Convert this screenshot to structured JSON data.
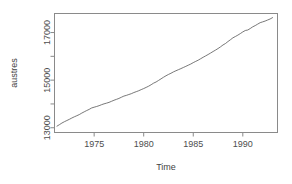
{
  "chart_data": {
    "type": "line",
    "title": "",
    "subtitle": "",
    "xlabel": "Time",
    "ylabel": "austres",
    "xlim": [
      1971.0,
      1993.5
    ],
    "ylim": [
      12800,
      17800
    ],
    "grid": false,
    "legend_position": "none",
    "xticks": [
      1975,
      1980,
      1985,
      1990
    ],
    "xtick_labels": [
      "1975",
      "1980",
      "1985",
      "1990"
    ],
    "yticks": [
      13000,
      14000,
      15000,
      16000,
      17000
    ],
    "ytick_labels": [
      "13000",
      "",
      "15000",
      "",
      "17000"
    ],
    "ytick_labels_shown": [
      "13000",
      "15000",
      "17000"
    ],
    "ytick_label_rotation": 90,
    "series": [
      {
        "name": "austres",
        "color": "#555555",
        "line_width": 0.8,
        "x": [
          1971.25,
          1971.5,
          1971.75,
          1972.0,
          1972.25,
          1972.5,
          1972.75,
          1973.0,
          1973.25,
          1973.5,
          1973.75,
          1974.0,
          1974.25,
          1974.5,
          1974.75,
          1975.0,
          1975.25,
          1975.5,
          1975.75,
          1976.0,
          1976.25,
          1976.5,
          1976.75,
          1977.0,
          1977.25,
          1977.5,
          1977.75,
          1978.0,
          1978.25,
          1978.5,
          1978.75,
          1979.0,
          1979.25,
          1979.5,
          1979.75,
          1980.0,
          1980.25,
          1980.5,
          1980.75,
          1981.0,
          1981.25,
          1981.5,
          1981.75,
          1982.0,
          1982.25,
          1982.5,
          1982.75,
          1983.0,
          1983.25,
          1983.5,
          1983.75,
          1984.0,
          1984.25,
          1984.5,
          1984.75,
          1985.0,
          1985.25,
          1985.5,
          1985.75,
          1986.0,
          1986.25,
          1986.5,
          1986.75,
          1987.0,
          1987.25,
          1987.5,
          1987.75,
          1988.0,
          1988.25,
          1988.5,
          1988.75,
          1989.0,
          1989.25,
          1989.5,
          1989.75,
          1990.0,
          1990.25,
          1990.5,
          1990.75,
          1991.0,
          1991.25,
          1991.5,
          1991.75,
          1992.0,
          1992.25,
          1992.5,
          1992.75,
          1993.0
        ],
        "y": [
          13067.3,
          13130.5,
          13198.4,
          13254.2,
          13303.7,
          13353.9,
          13409.1,
          13459.2,
          13504.5,
          13552.6,
          13614.3,
          13669.5,
          13722.6,
          13772.1,
          13832.0,
          13862.6,
          13893.0,
          13926.8,
          13968.9,
          14004.7,
          14033.1,
          14066.0,
          14110.1,
          14155.6,
          14192.2,
          14231.7,
          14281.5,
          14330.3,
          14359.3,
          14396.6,
          14430.8,
          14478.4,
          14515.7,
          14554.9,
          14602.5,
          14646.4,
          14695.4,
          14746.6,
          14807.4,
          14874.4,
          14923.3,
          14988.7,
          15054.1,
          15121.7,
          15184.2,
          15239.3,
          15288.9,
          15346.2,
          15393.5,
          15439.0,
          15483.5,
          15531.5,
          15579.4,
          15628.5,
          15677.3,
          15736.7,
          15788.3,
          15839.7,
          15900.6,
          15961.5,
          16018.3,
          16076.9,
          16139.0,
          16203.0,
          16263.3,
          16327.9,
          16398.9,
          16478.3,
          16538.2,
          16621.6,
          16697.0,
          16777.2,
          16833.1,
          16891.6,
          16956.8,
          17026.3,
          17085.4,
          17106.9,
          17169.4,
          17239.4,
          17292.0,
          17354.2,
          17414.2,
          17447.3,
          17482.6,
          17526.0,
          17568.7,
          17627.1
        ],
        "y_units": "thousands of persons"
      }
    ],
    "annotations": []
  },
  "axes": {
    "x_axis_label": "Time",
    "y_axis_label": "austres"
  },
  "style": {
    "background_color": "#ffffff",
    "axis_color": "#808080",
    "tick_color": "#808080",
    "text_color": "#4d4d4d",
    "line_color": "#555555"
  }
}
